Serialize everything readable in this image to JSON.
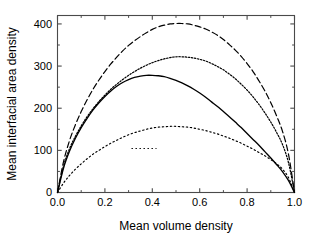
{
  "chart_data": {
    "type": "line",
    "title": "",
    "xlabel": "Mean volume density",
    "ylabel": "Mean interfacial area density",
    "xlim": [
      0.0,
      1.0
    ],
    "ylim": [
      0,
      420
    ],
    "xticks": [
      "0.0",
      "0.2",
      "0.4",
      "0.6",
      "0.8",
      "1.0"
    ],
    "xtick_values": [
      0.0,
      0.2,
      0.4,
      0.6,
      0.8,
      1.0
    ],
    "yticks": [
      "0",
      "100",
      "200",
      "300",
      "400"
    ],
    "ytick_values": [
      0,
      100,
      200,
      300,
      400
    ],
    "grid": false,
    "legend_position": "center",
    "x": [
      0.0,
      0.025,
      0.05,
      0.075,
      0.1,
      0.125,
      0.15,
      0.175,
      0.2,
      0.225,
      0.25,
      0.275,
      0.3,
      0.325,
      0.35,
      0.375,
      0.4,
      0.425,
      0.45,
      0.475,
      0.5,
      0.525,
      0.55,
      0.575,
      0.6,
      0.625,
      0.65,
      0.675,
      0.7,
      0.725,
      0.75,
      0.775,
      0.8,
      0.825,
      0.85,
      0.875,
      0.9,
      0.925,
      0.95,
      0.975,
      1.0
    ],
    "series": [
      {
        "name": "Sv(t,0.05)",
        "style": "dotted-sparse",
        "peak_x": 0.42,
        "peak_y": 157,
        "values": [
          0,
          22,
          40,
          55,
          68,
          80,
          91,
          100,
          109,
          117,
          124,
          131,
          137,
          142,
          146,
          150,
          153,
          155,
          156,
          157,
          157,
          156,
          155,
          153,
          150,
          147,
          143,
          139,
          134,
          129,
          123,
          117,
          110,
          103,
          95,
          87,
          78,
          68,
          55,
          35,
          0
        ]
      },
      {
        "name": "Sv(t,0.5)",
        "style": "dotted-fine",
        "peak_x": 0.47,
        "peak_y": 322,
        "values": [
          0,
          62,
          103,
          133,
          158,
          180,
          199,
          216,
          231,
          245,
          257,
          268,
          278,
          287,
          295,
          302,
          308,
          313,
          317,
          320,
          322,
          322,
          321,
          319,
          316,
          312,
          306,
          299,
          291,
          281,
          270,
          257,
          243,
          227,
          209,
          189,
          167,
          142,
          113,
          70,
          0
        ]
      },
      {
        "name": "Sv(t,0.95)",
        "style": "dashed",
        "peak_x": 0.5,
        "peak_y": 401,
        "values": [
          0,
          72,
          122,
          160,
          192,
          220,
          245,
          267,
          287,
          305,
          321,
          336,
          349,
          360,
          370,
          379,
          387,
          393,
          397,
          400,
          401,
          401,
          400,
          397,
          393,
          388,
          381,
          373,
          363,
          351,
          338,
          323,
          306,
          287,
          265,
          241,
          213,
          181,
          144,
          90,
          0
        ]
      },
      {
        "name": "interfacial area per unit of volume",
        "style": "solid",
        "peak_x": 0.41,
        "peak_y": 278,
        "values": [
          0,
          57,
          97,
          128,
          154,
          176,
          196,
          213,
          228,
          241,
          252,
          261,
          268,
          273,
          276,
          278,
          278,
          277,
          275,
          271,
          266,
          260,
          253,
          245,
          236,
          226,
          215,
          204,
          192,
          180,
          167,
          154,
          140,
          126,
          112,
          97,
          82,
          66,
          49,
          28,
          0
        ]
      }
    ]
  },
  "legend": {
    "entries": [
      {
        "symbol": "S",
        "subscript": "v",
        "args": "(t,0.05)",
        "plain": "Sv(t,0.05)",
        "style": "dotted-sparse"
      },
      {
        "symbol": "S",
        "subscript": "v",
        "args": "(t,0.5)",
        "plain": "Sv(t,0.5)",
        "style": "dotted-fine"
      },
      {
        "symbol": "S",
        "subscript": "v",
        "args": "(t,0.95)",
        "plain": "Sv(t,0.95)",
        "style": "dashed"
      },
      {
        "symbol": "",
        "subscript": "",
        "args": "interfacial area per unit of volume",
        "plain": "interfacial area per unit of volume",
        "style": "solid"
      }
    ]
  },
  "axes": {
    "x_title": "Mean volume density",
    "y_title": "Mean interfacial area density",
    "x_tick_labels": [
      "0.0",
      "0.2",
      "0.4",
      "0.6",
      "0.8",
      "1.0"
    ],
    "y_tick_labels": [
      "0",
      "100",
      "200",
      "300",
      "400"
    ]
  },
  "colors": {
    "line": "#000000",
    "frame": "#4a4a4a",
    "background": "#ffffff"
  }
}
